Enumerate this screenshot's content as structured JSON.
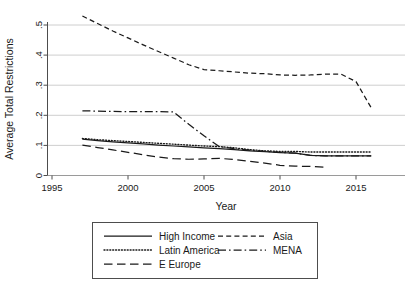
{
  "chart_data": {
    "type": "line",
    "title": "",
    "xlabel": "Year",
    "ylabel": "Average Total Restrictions",
    "xlim": [
      1995,
      2016.5
    ],
    "ylim": [
      0,
      0.55
    ],
    "xticks": [
      1995,
      2000,
      2005,
      2010,
      2015
    ],
    "xtick_labels": [
      "1995",
      "2000",
      "2005",
      "2010",
      "2015"
    ],
    "yticks": [
      0,
      0.1,
      0.2,
      0.3,
      0.4,
      0.5
    ],
    "ytick_labels": [
      "0",
      ".1",
      ".2",
      ".3",
      ".4",
      ".5"
    ],
    "grid": "horizontal",
    "legend_position": "below-plot",
    "series": [
      {
        "name": "High Income",
        "dash": "solid",
        "x": [
          1997,
          1998,
          1999,
          2000,
          2001,
          2002,
          2003,
          2004,
          2005,
          2006,
          2007,
          2008,
          2009,
          2010,
          2011,
          2012,
          2013,
          2014,
          2015,
          2016
        ],
        "values": [
          0.121,
          0.116,
          0.112,
          0.108,
          0.105,
          0.101,
          0.098,
          0.095,
          0.092,
          0.089,
          0.086,
          0.082,
          0.079,
          0.076,
          0.074,
          0.067,
          0.065,
          0.065,
          0.065,
          0.065
        ]
      },
      {
        "name": "Latin America",
        "dash": "dotted",
        "x": [
          1997,
          1998,
          1999,
          2000,
          2001,
          2002,
          2003,
          2004,
          2005,
          2006,
          2007,
          2008,
          2009,
          2010,
          2011,
          2012,
          2013,
          2014,
          2015,
          2016
        ],
        "values": [
          0.123,
          0.119,
          0.116,
          0.113,
          0.11,
          0.107,
          0.104,
          0.101,
          0.098,
          0.096,
          0.092,
          0.086,
          0.082,
          0.08,
          0.08,
          0.078,
          0.078,
          0.078,
          0.078,
          0.078
        ]
      },
      {
        "name": "E Europe",
        "dash": "long-dash",
        "x": [
          1997,
          1998,
          1999,
          2000,
          2001,
          2002,
          2003,
          2004,
          2005,
          2006,
          2007,
          2008,
          2009,
          2010,
          2011,
          2012,
          2013
        ],
        "values": [
          0.101,
          0.093,
          0.085,
          0.077,
          0.069,
          0.061,
          0.056,
          0.054,
          0.055,
          0.057,
          0.053,
          0.047,
          0.041,
          0.034,
          0.031,
          0.03,
          0.027
        ]
      },
      {
        "name": "Asia",
        "dash": "short-dash",
        "x": [
          1997,
          1998,
          1999,
          2000,
          2001,
          2002,
          2003,
          2004,
          2005,
          2006,
          2007,
          2008,
          2009,
          2010,
          2011,
          2012,
          2013,
          2014,
          2015,
          2016
        ],
        "values": [
          0.53,
          0.505,
          0.48,
          0.457,
          0.434,
          0.412,
          0.39,
          0.368,
          0.352,
          0.348,
          0.344,
          0.34,
          0.338,
          0.334,
          0.333,
          0.334,
          0.337,
          0.337,
          0.312,
          0.225
        ]
      },
      {
        "name": "MENA",
        "dash": "dash-dot",
        "x": [
          1997,
          1998,
          1999,
          2000,
          2001,
          2002,
          2003,
          2004,
          2005,
          2006,
          2007,
          2008,
          2009,
          2010,
          2011,
          2012,
          2013,
          2014,
          2015,
          2016
        ],
        "values": [
          0.215,
          0.214,
          0.213,
          0.212,
          0.212,
          0.212,
          0.211,
          0.17,
          0.132,
          0.096,
          0.089,
          0.084,
          0.08,
          0.077,
          0.074,
          0.067,
          0.065,
          0.065,
          0.065,
          0.065
        ]
      }
    ]
  },
  "legend": {
    "entries": [
      {
        "label": "High Income",
        "dash": "solid"
      },
      {
        "label": "Asia",
        "dash": "short-dash"
      },
      {
        "label": "Latin America",
        "dash": "dotted"
      },
      {
        "label": "MENA",
        "dash": "dash-dot"
      },
      {
        "label": "E Europe",
        "dash": "long-dash"
      }
    ]
  },
  "colors": {
    "line": "#1a1a1a",
    "grid": "#c8c8c8",
    "axis": "#4d4d4d",
    "background": "#ffffff"
  }
}
